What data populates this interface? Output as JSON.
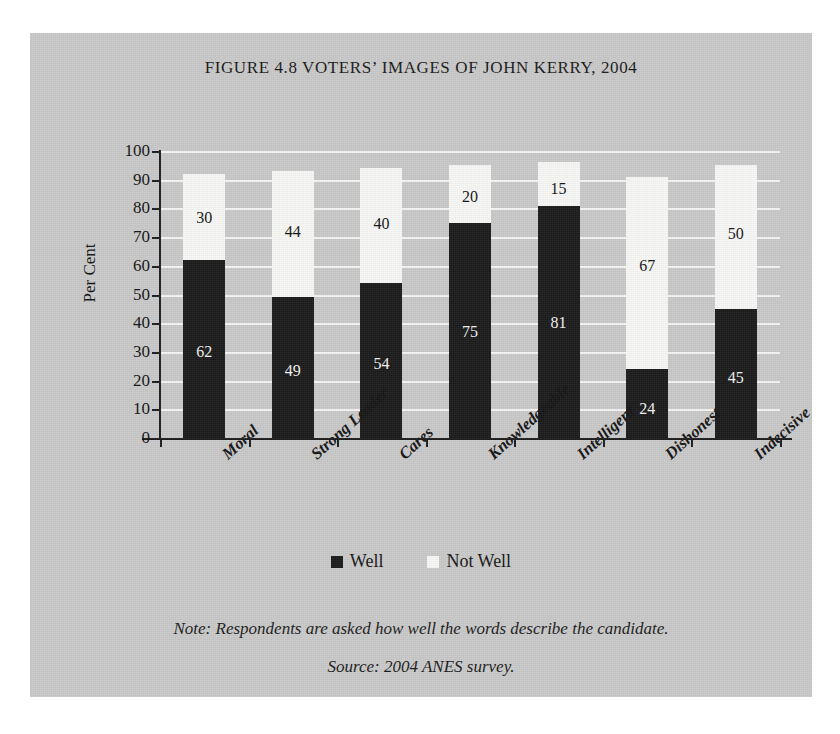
{
  "figure": {
    "title": "FIGURE 4.8 VOTERS’ IMAGES OF JOHN KERRY, 2004",
    "panel_color": "#c9c9c9",
    "notes": [
      "Note: Respondents are asked how well the words describe the candidate.",
      "Source: 2004 ANES survey."
    ]
  },
  "legend": {
    "items": [
      {
        "label": "Well",
        "color": "#1a1a1a"
      },
      {
        "label": "Not Well",
        "color": "#f7f7f5"
      }
    ]
  },
  "axes": {
    "y_title": "Per Cent",
    "y_ticks": [
      "100",
      "90",
      "80",
      "70",
      "60",
      "50",
      "40",
      "30",
      "20",
      "10",
      "0"
    ]
  },
  "chart_data": {
    "type": "bar",
    "subtype": "stacked",
    "title": "FIGURE 4.8 VOTERS’ IMAGES OF JOHN KERRY, 2004",
    "xlabel": "",
    "ylabel": "Per Cent",
    "ylim": [
      0,
      100
    ],
    "ytick_step": 10,
    "grid": true,
    "legend_position": "bottom-center",
    "categories": [
      "Moral",
      "Strong Leader",
      "Cares",
      "Knowledgeable",
      "Intelligent",
      "Dishonest",
      "Indecisive"
    ],
    "series": [
      {
        "name": "Well",
        "color": "#1a1a1a",
        "values": [
          62,
          49,
          54,
          75,
          81,
          24,
          45
        ]
      },
      {
        "name": "Not Well",
        "color": "#f7f7f5",
        "values": [
          30,
          44,
          40,
          20,
          15,
          67,
          50
        ]
      }
    ],
    "totals": [
      92,
      93,
      94,
      95,
      96,
      91,
      95
    ]
  }
}
